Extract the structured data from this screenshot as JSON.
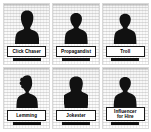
{
  "figure": {
    "kind": "persona-card-grid",
    "columns": 3,
    "rows": 2,
    "background_color": "#ffffff",
    "card_background_color": "#f7f7f7",
    "card_border_color": "#d9d9d9",
    "silhouette_color": "#111111",
    "nameplate_border_color": "#1a1a1a",
    "nameplate_fill_color": "#ffffff",
    "nameplate_text_color": "#000000"
  },
  "cards": [
    {
      "id": "click-chaser",
      "label": "Click Chaser",
      "icon": "person-silhouette-icon",
      "hair_style": "tall-voluminous"
    },
    {
      "id": "propagandist",
      "label": "Propagandist",
      "icon": "person-silhouette-icon",
      "hair_style": "short-round"
    },
    {
      "id": "troll",
      "label": "Troll",
      "icon": "person-silhouette-icon",
      "hair_style": "short-round"
    },
    {
      "id": "lemming",
      "label": "Lemming",
      "icon": "person-silhouette-icon",
      "hair_style": "wavy-curly"
    },
    {
      "id": "jokester",
      "label": "Jokester",
      "icon": "person-silhouette-icon",
      "hair_style": "bob-shoulder"
    },
    {
      "id": "influencer-for-hire",
      "label": "Influencer\nfor Hire",
      "icon": "person-silhouette-icon",
      "hair_style": "short-round"
    }
  ]
}
